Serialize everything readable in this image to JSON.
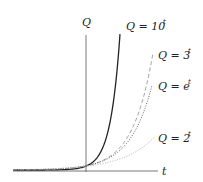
{
  "chart_data": {
    "type": "line",
    "title": "",
    "xlabel": "t",
    "ylabel": "Q",
    "grid": false,
    "legend_position": "inline-right",
    "series": [
      {
        "name": "Q = 10^t",
        "label_base": "Q = 10",
        "label_exp": "t",
        "style": "solid",
        "color": "#222222",
        "base": 10
      },
      {
        "name": "Q = 3^t",
        "label_base": "Q = 3",
        "label_exp": "t",
        "style": "dashed",
        "color": "#9a9a9a",
        "base": 3
      },
      {
        "name": "Q = e^t",
        "label_base": "Q = e",
        "label_exp": "t",
        "style": "dotted",
        "color": "#555555",
        "base": 2.71828
      },
      {
        "name": "Q = 2^t",
        "label_base": "Q = 2",
        "label_exp": "t",
        "style": "dotted",
        "color": "#aaaaaa",
        "base": 2
      }
    ],
    "x_range": [
      -3,
      3
    ],
    "y_range": [
      0,
      10
    ]
  },
  "axes": {
    "x_label": "t",
    "y_label": "Q"
  }
}
